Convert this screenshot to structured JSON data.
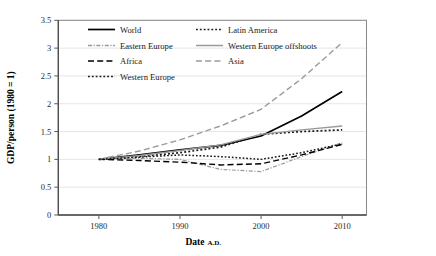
{
  "chart_data": {
    "type": "line",
    "title": "",
    "xlabel": "Date",
    "xlabel_suffix": "A.D.",
    "ylabel": "GDP/person (1980 = 1)",
    "xlim": [
      1975,
      2013
    ],
    "ylim": [
      0,
      3.5
    ],
    "xticks": [
      1980,
      1990,
      2000,
      2010
    ],
    "yticks": [
      0,
      0.5,
      1,
      1.5,
      2,
      2.5,
      3,
      3.5
    ],
    "ytick_labels": [
      "0",
      "0.5",
      "1",
      "1.5",
      "2",
      "2.5",
      "3",
      "3.5"
    ],
    "xtick_labels": [
      "1980",
      "1990",
      "2000",
      "2010"
    ],
    "grid": "horizontal",
    "legend_position": "upper-left-inside",
    "x": [
      1980,
      1985,
      1990,
      1995,
      2000,
      2005,
      2010
    ],
    "series": [
      {
        "name": "World",
        "style": "solid",
        "color": "#000000",
        "width": 1.7,
        "values": [
          1.0,
          1.08,
          1.17,
          1.25,
          1.42,
          1.78,
          2.22
        ]
      },
      {
        "name": "Latin America",
        "style": "dotted-square",
        "color": "#1a1a1a",
        "width": 1.7,
        "values": [
          1.0,
          1.05,
          1.12,
          1.22,
          1.45,
          1.5,
          1.53
        ]
      },
      {
        "name": "Eastern Europe",
        "style": "dash-dot-fine",
        "color": "#9a9a9a",
        "width": 1.2,
        "values": [
          1.0,
          1.02,
          1.0,
          0.82,
          0.78,
          1.05,
          1.3
        ]
      },
      {
        "name": "Western Europe offshoots",
        "style": "solid",
        "color": "#9a9a9a",
        "width": 1.4,
        "values": [
          1.0,
          1.07,
          1.16,
          1.26,
          1.45,
          1.53,
          1.6
        ]
      },
      {
        "name": "Africa",
        "style": "dashed-long",
        "color": "#000000",
        "width": 1.4,
        "values": [
          1.0,
          0.98,
          0.95,
          0.9,
          0.92,
          1.08,
          1.27
        ]
      },
      {
        "name": "Asia",
        "style": "dashed-long",
        "color": "#9a9a9a",
        "width": 1.4,
        "values": [
          1.0,
          1.15,
          1.35,
          1.6,
          1.9,
          2.45,
          3.1
        ]
      },
      {
        "name": "Western Europe",
        "style": "dotted-square",
        "color": "#1a1a1a",
        "width": 1.5,
        "values": [
          1.0,
          1.04,
          1.08,
          1.05,
          1.0,
          1.12,
          1.28
        ]
      }
    ],
    "legend": [
      {
        "label": "World",
        "style": "solid",
        "color": "#000000"
      },
      {
        "label": "Latin America",
        "style": "dotted-square",
        "color": "#1a1a1a"
      },
      {
        "label": "Eastern Europe",
        "style": "dash-dot-fine",
        "color": "#9a9a9a"
      },
      {
        "label": "Western Europe offshoots",
        "style": "solid",
        "color": "#9a9a9a"
      },
      {
        "label": "Africa",
        "style": "dashed-long",
        "color": "#000000"
      },
      {
        "label": "Asia",
        "style": "dashed-long",
        "color": "#9a9a9a"
      },
      {
        "label": "Western Europe",
        "style": "dotted-square",
        "color": "#1a1a1a"
      }
    ],
    "colors": {
      "plot_border": "#8a8a8a",
      "gridline": "#e0e0e0",
      "axis_line": "#5a5a5a",
      "background": "#ffffff"
    }
  }
}
